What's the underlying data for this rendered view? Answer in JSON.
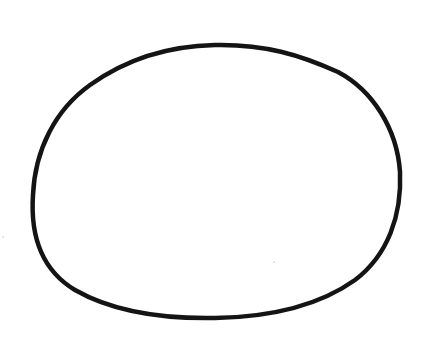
{
  "drawing": {
    "subject": "hand-drawn oval outline",
    "stroke_color": "#141414",
    "background_color": "#ffffff"
  }
}
